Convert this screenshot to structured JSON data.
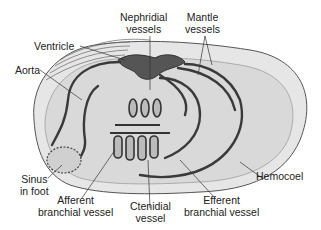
{
  "figure": {
    "labels": {
      "nephridial_vessels": [
        "Nephridial",
        "vessels"
      ],
      "mantle_vessels": [
        "Mantle",
        "vessels"
      ],
      "ventricle": "Ventricle",
      "aorta": "Aorta",
      "sinus_in_foot": [
        "Sinus",
        "in foot"
      ],
      "afferent_branchial_vessel": [
        "Afferent",
        "branchial vessel"
      ],
      "ctenidial_vessel": [
        "Ctenidial",
        "vessel"
      ],
      "efferent_branchial_vessel": [
        "Efferent",
        "branchial vessel"
      ],
      "hemocoel": "Hemocoel"
    }
  },
  "colors": {
    "shell_fill": "#e4e4e4",
    "inner_fill": "#d6d6d6",
    "vessel": "#3a3a3a",
    "heart": "#555555",
    "text": "#222222"
  }
}
